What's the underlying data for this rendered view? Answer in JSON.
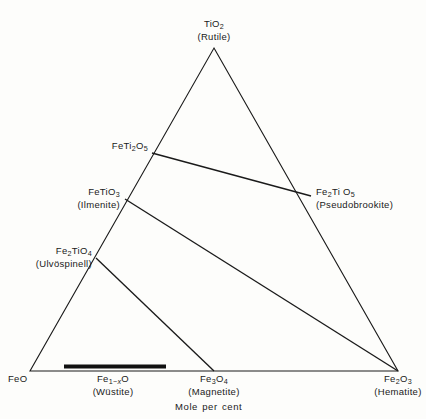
{
  "figure": {
    "type": "ternary-phase-diagram",
    "system": "FeO - Fe2O3 - TiO2",
    "axis_caption": "Mole per cent",
    "background_color": "#fdfdfb",
    "line_color": "#1a1a1a"
  },
  "vertices": {
    "top": {
      "formula": "TiO₂",
      "mineral": "(Rutile)",
      "formula_html": "TiO<sub>2</sub>",
      "x": 214,
      "y": 48
    },
    "bottom_left": {
      "formula": "FeO",
      "mineral": "",
      "formula_html": "FeO",
      "x": 30,
      "y": 371
    },
    "bottom_right": {
      "formula": "Fe₂O₃",
      "mineral": "(Hematite)",
      "formula_html": "Fe<sub>2</sub>O<sub>3</sub>",
      "x": 398,
      "y": 371
    }
  },
  "compounds": [
    {
      "name": "pseudo-ferrobrookite",
      "formula": "FeTi₂O₅",
      "formula_html": "FeTi<sub>2</sub>O<sub>5</sub>",
      "mineral": "",
      "x": 152,
      "y": 153
    },
    {
      "name": "ilmenite",
      "formula": "FeTiO₃",
      "formula_html": "FeTiO<sub>3</sub>",
      "mineral": "(Ilmenite)",
      "x": 125,
      "y": 199
    },
    {
      "name": "ulvospinel",
      "formula": "Fe₂TiO₄",
      "formula_html": "Fe<sub>2</sub>TiO<sub>4</sub>",
      "mineral": "(Ulvöspinell)",
      "x": 96,
      "y": 258
    },
    {
      "name": "pseudobrookite",
      "formula": "Fe₂TiO₅",
      "formula_html": "Fe<sub>2</sub>Ti O<sub>5</sub>",
      "mineral": "(Pseudobrookite)",
      "x": 311,
      "y": 196
    },
    {
      "name": "wustite",
      "formula": "Fe₁₋ₓO",
      "formula_html": "Fe<sub>1−<i>x</i></sub>O",
      "mineral": "(Wüstite)",
      "x": 113,
      "y": 371
    },
    {
      "name": "magnetite",
      "formula": "Fe₃O₄",
      "formula_html": "Fe<sub>3</sub>O<sub>4</sub>",
      "mineral": "(Magnetite)",
      "x": 214,
      "y": 371
    }
  ],
  "tie_lines": [
    {
      "name": "FeTi2O5-Fe2TiO5",
      "from": "FeTi₂O₅",
      "to": "Fe₂TiO₅"
    },
    {
      "name": "FeTiO3-Fe2O3",
      "from": "FeTiO₃",
      "to": "Fe₂O₃"
    },
    {
      "name": "Fe2TiO4-Fe3O4",
      "from": "Fe₂TiO₄",
      "to": "Fe₃O₄"
    },
    {
      "name": "Fe2TiO5-Fe2O3",
      "from": "Fe₂TiO₅",
      "to": "Fe₂O₃"
    }
  ],
  "solid_solution_bar": {
    "name": "wustite-solid-solution",
    "label": "Fe₁₋ₓO",
    "x_start": 64,
    "x_end": 166,
    "y": 366
  },
  "chart_data": {
    "type": "scatter",
    "title": "",
    "xlabel": "Mole per cent",
    "ylabel": "",
    "grid": false,
    "legend": null,
    "axes": [
      "FeO",
      "Fe2O3",
      "TiO2"
    ],
    "annotations": [
      "TiO2 (Rutile)",
      "FeTi2O5",
      "FeTiO3 (Ilmenite)",
      "Fe2TiO5 (Pseudobrookite)",
      "Fe2TiO4 (Ulvöspinell)",
      "FeO",
      "Fe1-xO (Wüstite)",
      "Fe3O4 (Magnetite)",
      "Fe2O3 (Hematite)"
    ]
  }
}
